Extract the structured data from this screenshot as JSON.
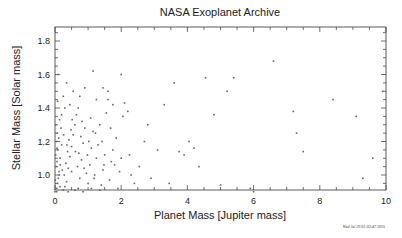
{
  "chart_data": {
    "type": "scatter",
    "title": "NASA Exoplanet Archive",
    "xlabel": "Planet Mass [Jupiter mass]",
    "ylabel": "Stellar Mass [Solar mass]",
    "xlim": [
      0,
      10.1
    ],
    "ylim": [
      0.9,
      1.9
    ],
    "x_ticks": [
      "0",
      "2",
      "4",
      "6",
      "8",
      "10"
    ],
    "y_ticks": [
      "1.0",
      "1.2",
      "1.4",
      "1.6",
      "1.8"
    ],
    "grid": false,
    "legend": null,
    "timestamp": "Wed Jul 29 01:03:47 2015",
    "points": [
      [
        0.05,
        0.92
      ],
      [
        0.08,
        0.95
      ],
      [
        0.1,
        0.98
      ],
      [
        0.12,
        1.02
      ],
      [
        0.03,
        1.05
      ],
      [
        0.06,
        1.08
      ],
      [
        0.15,
        1.1
      ],
      [
        0.02,
        1.12
      ],
      [
        0.09,
        1.15
      ],
      [
        0.2,
        1.18
      ],
      [
        0.04,
        1.2
      ],
      [
        0.11,
        1.22
      ],
      [
        0.07,
        1.25
      ],
      [
        0.18,
        1.28
      ],
      [
        0.02,
        1.3
      ],
      [
        0.14,
        1.33
      ],
      [
        0.05,
        0.9
      ],
      [
        0.01,
        0.97
      ],
      [
        0.13,
        1.0
      ],
      [
        0.22,
        1.03
      ],
      [
        0.3,
        0.93
      ],
      [
        0.35,
        0.96
      ],
      [
        0.28,
        1.0
      ],
      [
        0.4,
        1.04
      ],
      [
        0.33,
        1.07
      ],
      [
        0.45,
        1.11
      ],
      [
        0.38,
        1.14
      ],
      [
        0.5,
        1.17
      ],
      [
        0.42,
        1.21
      ],
      [
        0.55,
        1.24
      ],
      [
        0.48,
        1.27
      ],
      [
        0.6,
        1.3
      ],
      [
        0.52,
        1.33
      ],
      [
        0.65,
        1.36
      ],
      [
        0.3,
        1.4
      ],
      [
        0.45,
        1.42
      ],
      [
        0.7,
        0.92
      ],
      [
        0.75,
        0.98
      ],
      [
        0.68,
        1.05
      ],
      [
        0.8,
        1.09
      ],
      [
        0.72,
        1.13
      ],
      [
        0.85,
        1.19
      ],
      [
        0.78,
        1.23
      ],
      [
        0.9,
        1.28
      ],
      [
        0.82,
        1.32
      ],
      [
        0.95,
        1.01
      ],
      [
        1.0,
        0.95
      ],
      [
        1.05,
        1.06
      ],
      [
        0.98,
        1.12
      ],
      [
        1.1,
        1.16
      ],
      [
        1.02,
        1.2
      ],
      [
        1.15,
        1.26
      ],
      [
        1.08,
        1.34
      ],
      [
        1.2,
        1.0
      ],
      [
        1.25,
        1.1
      ],
      [
        1.3,
        1.18
      ],
      [
        1.22,
        1.25
      ],
      [
        1.35,
        1.3
      ],
      [
        1.4,
        0.94
      ],
      [
        1.45,
        1.03
      ],
      [
        1.5,
        1.12
      ],
      [
        1.42,
        1.2
      ],
      [
        1.55,
        1.37
      ],
      [
        1.6,
        1.45
      ],
      [
        1.65,
        0.97
      ],
      [
        1.7,
        1.08
      ],
      [
        1.75,
        1.15
      ],
      [
        1.68,
        1.28
      ],
      [
        1.8,
        1.06
      ],
      [
        1.85,
        1.22
      ],
      [
        1.9,
        0.92
      ],
      [
        1.95,
        1.02
      ],
      [
        2.0,
        1.1
      ],
      [
        2.05,
        1.35
      ],
      [
        2.1,
        1.43
      ],
      [
        2.2,
        1.38
      ],
      [
        2.3,
        1.0
      ],
      [
        0.25,
        1.47
      ],
      [
        0.55,
        1.5
      ],
      [
        0.9,
        1.52
      ],
      [
        1.25,
        1.45
      ],
      [
        1.6,
        1.5
      ],
      [
        0.35,
        1.55
      ],
      [
        1.15,
        1.62
      ],
      [
        1.75,
        1.42
      ],
      [
        2.25,
        1.12
      ],
      [
        2.4,
        0.95
      ],
      [
        2.55,
        1.05
      ],
      [
        2.7,
        1.2
      ],
      [
        2.8,
        1.3
      ],
      [
        2.9,
        0.98
      ],
      [
        3.1,
        1.15
      ],
      [
        3.3,
        1.42
      ],
      [
        3.45,
        0.95
      ],
      [
        3.6,
        1.55
      ],
      [
        3.75,
        1.14
      ],
      [
        3.9,
        1.12
      ],
      [
        4.05,
        1.2
      ],
      [
        4.2,
        1.16
      ],
      [
        4.35,
        1.05
      ],
      [
        4.55,
        1.58
      ],
      [
        4.8,
        1.36
      ],
      [
        5.0,
        0.94
      ],
      [
        5.2,
        1.5
      ],
      [
        5.4,
        1.58
      ],
      [
        5.9,
        0.92
      ],
      [
        6.0,
        0.9
      ],
      [
        6.6,
        1.68
      ],
      [
        7.2,
        1.38
      ],
      [
        7.3,
        1.25
      ],
      [
        7.5,
        1.14
      ],
      [
        8.4,
        1.45
      ],
      [
        9.1,
        1.35
      ],
      [
        9.3,
        0.98
      ],
      [
        9.6,
        1.1
      ],
      [
        9.9,
        1.5
      ],
      [
        0.0,
        0.9
      ],
      [
        0.15,
        0.93
      ],
      [
        0.25,
        0.91
      ],
      [
        0.4,
        0.9
      ],
      [
        0.6,
        0.91
      ],
      [
        0.85,
        0.9
      ],
      [
        1.1,
        0.92
      ],
      [
        1.35,
        0.91
      ],
      [
        0.2,
        1.36
      ],
      [
        0.08,
        1.44
      ],
      [
        0.1,
        1.6
      ],
      [
        2.0,
        1.6
      ],
      [
        1.45,
        1.52
      ],
      [
        0.75,
        1.47
      ],
      [
        0.5,
        1.02
      ],
      [
        0.62,
        1.14
      ],
      [
        0.88,
        1.04
      ],
      [
        1.18,
        0.98
      ],
      [
        1.48,
        1.06
      ],
      [
        0.36,
        1.18
      ],
      [
        0.26,
        1.24
      ],
      [
        0.16,
        1.06
      ],
      [
        0.06,
        1.16
      ],
      [
        0.7,
        1.4
      ]
    ]
  },
  "header": {
    "title": "NASA Exoplanet Archive"
  }
}
